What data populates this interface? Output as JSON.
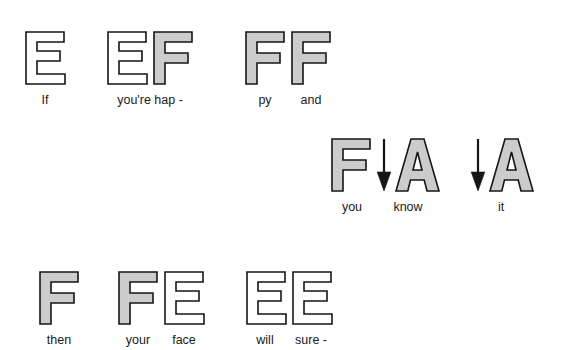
{
  "diagram": {
    "colors": {
      "bell_filled": "#cccccc",
      "bell_outline": "#ffffff",
      "stroke": "#161616",
      "text": "#1a1a1a",
      "background": "#ffffff"
    },
    "rows": [
      {
        "id": "row-1",
        "groups": [
          {
            "id": "group-1-1",
            "letters": [
              {
                "letter": "E",
                "fill": "outline",
                "icon": "letter-e-outline"
              }
            ],
            "labels": [
              "If"
            ]
          },
          {
            "id": "group-1-2",
            "letters": [
              {
                "letter": "E",
                "fill": "outline",
                "icon": "letter-e-outline"
              },
              {
                "letter": "F",
                "fill": "gray",
                "icon": "letter-f-filled"
              }
            ],
            "labels": [
              "you're hap -"
            ]
          },
          {
            "id": "group-1-3",
            "letters": [
              {
                "letter": "F",
                "fill": "gray",
                "icon": "letter-f-filled"
              },
              {
                "letter": "F",
                "fill": "gray",
                "icon": "letter-f-filled"
              }
            ],
            "labels": [
              "py",
              "and"
            ]
          }
        ]
      },
      {
        "id": "row-2",
        "groups": [
          {
            "id": "group-2-1",
            "letters": [
              {
                "letter": "F",
                "fill": "gray",
                "icon": "letter-f-filled"
              },
              {
                "letter": "arrow",
                "fill": "none",
                "icon": "down-arrow-icon"
              },
              {
                "letter": "A",
                "fill": "gray",
                "icon": "letter-a-filled"
              }
            ],
            "labels": [
              "you",
              "know"
            ]
          },
          {
            "id": "group-2-2",
            "letters": [
              {
                "letter": "arrow",
                "fill": "none",
                "icon": "down-arrow-icon"
              },
              {
                "letter": "A",
                "fill": "gray",
                "icon": "letter-a-filled"
              }
            ],
            "labels": [
              "it"
            ]
          }
        ]
      },
      {
        "id": "row-3",
        "groups": [
          {
            "id": "group-3-1",
            "letters": [
              {
                "letter": "F",
                "fill": "gray",
                "icon": "letter-f-filled"
              }
            ],
            "labels": [
              "then"
            ]
          },
          {
            "id": "group-3-2",
            "letters": [
              {
                "letter": "F",
                "fill": "gray",
                "icon": "letter-f-filled"
              },
              {
                "letter": "E",
                "fill": "outline",
                "icon": "letter-e-outline"
              }
            ],
            "labels": [
              "your",
              "face"
            ]
          },
          {
            "id": "group-3-3",
            "letters": [
              {
                "letter": "E",
                "fill": "outline",
                "icon": "letter-e-outline"
              },
              {
                "letter": "E",
                "fill": "outline",
                "icon": "letter-e-outline"
              }
            ],
            "labels": [
              "will",
              "sure -"
            ]
          }
        ]
      }
    ],
    "lyrics_full": "If you're hap - py and you know it, then your face will sure -"
  }
}
